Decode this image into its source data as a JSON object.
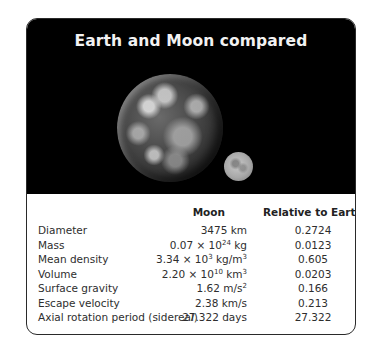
{
  "figure": {
    "title": "Earth and Moon compared",
    "image": {
      "objects": [
        "earth",
        "moon"
      ]
    }
  },
  "table": {
    "columns": [
      "",
      "Moon",
      "Relative to Earth"
    ],
    "rows": [
      {
        "label": "Diameter",
        "moon": {
          "base": "3475 km",
          "exp": "",
          "unit_after": ""
        },
        "relative": "0.2724"
      },
      {
        "label": "Mass",
        "moon": {
          "base": "0.07 × 10",
          "exp": "24",
          "unit_after": " kg"
        },
        "relative": "0.0123"
      },
      {
        "label": "Mean density",
        "moon": {
          "base": "3.34 × 10",
          "exp": "3",
          "unit_after": " kg/m",
          "unit_exp": "3"
        },
        "relative": "0.605"
      },
      {
        "label": "Volume",
        "moon": {
          "base": "2.20 × 10",
          "exp": "10",
          "unit_after": " km",
          "unit_exp": "3"
        },
        "relative": "0.0203"
      },
      {
        "label": "Surface gravity",
        "moon": {
          "base": "1.62 m/s",
          "exp": "2",
          "unit_after": ""
        },
        "relative": "0.166"
      },
      {
        "label": "Escape velocity",
        "moon": {
          "base": "2.38 km/s",
          "exp": "",
          "unit_after": ""
        },
        "relative": "0.213"
      },
      {
        "label": "Axial rotation period (sidereal)",
        "moon": {
          "base": "27.322 days",
          "exp": "",
          "unit_after": ""
        },
        "relative": "27.322"
      }
    ]
  }
}
